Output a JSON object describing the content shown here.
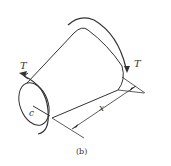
{
  "figure": {
    "caption": "(b)",
    "labels": {
      "torque_left": "T",
      "torque_right": "T",
      "radius": "c",
      "length": "x"
    },
    "colors": {
      "line": "#333333",
      "background": "#ffffff"
    }
  }
}
